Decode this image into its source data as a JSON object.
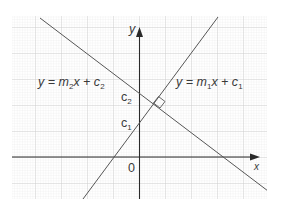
{
  "diagram": {
    "type": "coordinate-graph",
    "axes": {
      "x_label": "x",
      "y_label": "y",
      "origin_label": "0"
    },
    "lines": [
      {
        "id": "line1",
        "equation_prefix": "y = m",
        "slope_sub": "1",
        "equation_mid": "x + c",
        "intercept_sub": "1",
        "slope_sign": "positive"
      },
      {
        "id": "line2",
        "equation_prefix": "y = m",
        "slope_sub": "2",
        "equation_mid": "x + c",
        "intercept_sub": "2",
        "slope_sign": "negative"
      }
    ],
    "intercept_labels": [
      {
        "name": "c",
        "sub": "2"
      },
      {
        "name": "c",
        "sub": "1"
      }
    ],
    "right_angle_marker": true,
    "colors": {
      "line": "#555555",
      "axis": "#2a2a2a",
      "grid_minor": "#e4e4e4",
      "grid_major": "#c8c8c8",
      "text": "#3a3a3a"
    }
  }
}
